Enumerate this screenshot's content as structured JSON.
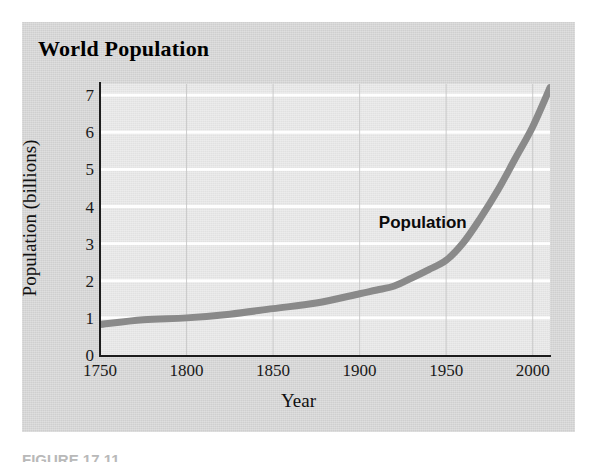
{
  "figure": {
    "title": "World Population",
    "caption": "FIGURE 17.11",
    "panel_color": "#d6d6d6",
    "plot_color": "#e9e9e9"
  },
  "chart_data": {
    "type": "line",
    "title": "World Population",
    "xlabel": "Year",
    "ylabel": "Population (billions)",
    "xlim": [
      1750,
      2010
    ],
    "ylim": [
      0,
      7.3
    ],
    "xticks": [
      1750,
      1800,
      1850,
      1900,
      1950,
      2000
    ],
    "xtick_labels": [
      "1750",
      "1800",
      "1850",
      "1900",
      "1950",
      "2000"
    ],
    "yticks": [
      0,
      1,
      2,
      3,
      4,
      5,
      6,
      7
    ],
    "ytick_labels": [
      "0",
      "1",
      "2",
      "3",
      "4",
      "5",
      "6",
      "7"
    ],
    "grid": "horizontal white gridlines at every integer; faint vertical gridlines at each 50-year tick",
    "legend_position": "inline annotation above curve",
    "series": [
      {
        "name": "Population",
        "color": "#8a8a8a",
        "line_width": 7,
        "x": [
          1750,
          1775,
          1800,
          1825,
          1850,
          1875,
          1900,
          1910,
          1920,
          1930,
          1940,
          1950,
          1960,
          1970,
          1980,
          1990,
          2000,
          2010
        ],
        "values": [
          0.82,
          0.95,
          1.0,
          1.1,
          1.25,
          1.4,
          1.65,
          1.75,
          1.86,
          2.07,
          2.3,
          2.55,
          3.03,
          3.7,
          4.45,
          5.3,
          6.15,
          7.2
        ]
      }
    ],
    "annotations": [
      {
        "text": "Population",
        "x": 1940,
        "y": 3.55
      }
    ]
  }
}
